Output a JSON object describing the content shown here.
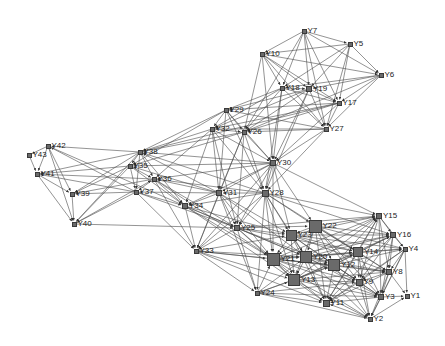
{
  "chart_data": {
    "type": "network",
    "title": "",
    "node_color": "#6a6a6a",
    "edge_color": "#4a4a4a",
    "nodes": [
      {
        "id": "Y1",
        "x": 407,
        "y": 296,
        "size": 5
      },
      {
        "id": "Y2",
        "x": 370,
        "y": 319,
        "size": 5
      },
      {
        "id": "Y3",
        "x": 381,
        "y": 297,
        "size": 6
      },
      {
        "id": "Y4",
        "x": 405,
        "y": 249,
        "size": 5
      },
      {
        "id": "Y5",
        "x": 350,
        "y": 44,
        "size": 5
      },
      {
        "id": "Y6",
        "x": 381,
        "y": 75,
        "size": 5
      },
      {
        "id": "Y7",
        "x": 304,
        "y": 31,
        "size": 5
      },
      {
        "id": "Y8",
        "x": 389,
        "y": 272,
        "size": 6
      },
      {
        "id": "Y9",
        "x": 359,
        "y": 282,
        "size": 7
      },
      {
        "id": "Y10",
        "x": 262,
        "y": 54,
        "size": 5
      },
      {
        "id": "Y11",
        "x": 326,
        "y": 303,
        "size": 7
      },
      {
        "id": "Y12",
        "x": 334,
        "y": 265,
        "size": 12
      },
      {
        "id": "Y13",
        "x": 294,
        "y": 280,
        "size": 12
      },
      {
        "id": "Y14",
        "x": 358,
        "y": 252,
        "size": 10
      },
      {
        "id": "Y15",
        "x": 379,
        "y": 216,
        "size": 6
      },
      {
        "id": "Y16",
        "x": 393,
        "y": 235,
        "size": 6
      },
      {
        "id": "Y17",
        "x": 339,
        "y": 103,
        "size": 5
      },
      {
        "id": "Y18",
        "x": 282,
        "y": 88,
        "size": 5
      },
      {
        "id": "Y19",
        "x": 309,
        "y": 89,
        "size": 6
      },
      {
        "id": "Y20",
        "x": 306,
        "y": 257,
        "size": 12
      },
      {
        "id": "Y21",
        "x": 273,
        "y": 259,
        "size": 13
      },
      {
        "id": "Y22",
        "x": 315,
        "y": 226,
        "size": 13
      },
      {
        "id": "Y23",
        "x": 291,
        "y": 235,
        "size": 11
      },
      {
        "id": "Y24",
        "x": 257,
        "y": 293,
        "size": 5
      },
      {
        "id": "Y25",
        "x": 237,
        "y": 228,
        "size": 6
      },
      {
        "id": "Y26",
        "x": 244,
        "y": 132,
        "size": 5
      },
      {
        "id": "Y27",
        "x": 326,
        "y": 129,
        "size": 5
      },
      {
        "id": "Y28",
        "x": 265,
        "y": 193,
        "size": 7
      },
      {
        "id": "Y29",
        "x": 226,
        "y": 110,
        "size": 5
      },
      {
        "id": "Y30",
        "x": 273,
        "y": 163,
        "size": 6
      },
      {
        "id": "Y31",
        "x": 219,
        "y": 193,
        "size": 6
      },
      {
        "id": "Y32",
        "x": 212,
        "y": 129,
        "size": 5
      },
      {
        "id": "Y33",
        "x": 196,
        "y": 251,
        "size": 5
      },
      {
        "id": "Y34",
        "x": 185,
        "y": 206,
        "size": 6
      },
      {
        "id": "Y35",
        "x": 130,
        "y": 166,
        "size": 5
      },
      {
        "id": "Y36",
        "x": 154,
        "y": 179,
        "size": 5
      },
      {
        "id": "Y37",
        "x": 136,
        "y": 192,
        "size": 5
      },
      {
        "id": "Y38",
        "x": 140,
        "y": 152,
        "size": 5
      },
      {
        "id": "Y39",
        "x": 72,
        "y": 194,
        "size": 5
      },
      {
        "id": "Y40",
        "x": 74,
        "y": 224,
        "size": 5
      },
      {
        "id": "Y41",
        "x": 37,
        "y": 174,
        "size": 5
      },
      {
        "id": "Y42",
        "x": 48,
        "y": 146,
        "size": 5
      },
      {
        "id": "Y43",
        "x": 29,
        "y": 155,
        "size": 5
      }
    ],
    "edges": [
      [
        "Y7",
        "Y10"
      ],
      [
        "Y7",
        "Y5"
      ],
      [
        "Y7",
        "Y6"
      ],
      [
        "Y7",
        "Y18"
      ],
      [
        "Y7",
        "Y19"
      ],
      [
        "Y7",
        "Y17"
      ],
      [
        "Y7",
        "Y27"
      ],
      [
        "Y7",
        "Y26"
      ],
      [
        "Y5",
        "Y10"
      ],
      [
        "Y5",
        "Y6"
      ],
      [
        "Y5",
        "Y18"
      ],
      [
        "Y5",
        "Y19"
      ],
      [
        "Y5",
        "Y17"
      ],
      [
        "Y5",
        "Y27"
      ],
      [
        "Y10",
        "Y6"
      ],
      [
        "Y10",
        "Y18"
      ],
      [
        "Y10",
        "Y19"
      ],
      [
        "Y10",
        "Y17"
      ],
      [
        "Y10",
        "Y27"
      ],
      [
        "Y10",
        "Y26"
      ],
      [
        "Y10",
        "Y30"
      ],
      [
        "Y6",
        "Y18"
      ],
      [
        "Y6",
        "Y19"
      ],
      [
        "Y6",
        "Y17"
      ],
      [
        "Y6",
        "Y26"
      ],
      [
        "Y6",
        "Y27"
      ],
      [
        "Y18",
        "Y19"
      ],
      [
        "Y18",
        "Y17"
      ],
      [
        "Y18",
        "Y27"
      ],
      [
        "Y18",
        "Y26"
      ],
      [
        "Y18",
        "Y29"
      ],
      [
        "Y18",
        "Y32"
      ],
      [
        "Y18",
        "Y30"
      ],
      [
        "Y18",
        "Y28"
      ],
      [
        "Y19",
        "Y17"
      ],
      [
        "Y19",
        "Y27"
      ],
      [
        "Y19",
        "Y26"
      ],
      [
        "Y19",
        "Y29"
      ],
      [
        "Y19",
        "Y32"
      ],
      [
        "Y19",
        "Y30"
      ],
      [
        "Y19",
        "Y28"
      ],
      [
        "Y17",
        "Y27"
      ],
      [
        "Y17",
        "Y26"
      ],
      [
        "Y17",
        "Y29"
      ],
      [
        "Y17",
        "Y32"
      ],
      [
        "Y17",
        "Y30"
      ],
      [
        "Y17",
        "Y38"
      ],
      [
        "Y27",
        "Y26"
      ],
      [
        "Y27",
        "Y32"
      ],
      [
        "Y27",
        "Y29"
      ],
      [
        "Y27",
        "Y30"
      ],
      [
        "Y27",
        "Y28"
      ],
      [
        "Y29",
        "Y32"
      ],
      [
        "Y29",
        "Y26"
      ],
      [
        "Y29",
        "Y30"
      ],
      [
        "Y29",
        "Y38"
      ],
      [
        "Y29",
        "Y35"
      ],
      [
        "Y29",
        "Y28"
      ],
      [
        "Y29",
        "Y31"
      ],
      [
        "Y32",
        "Y26"
      ],
      [
        "Y32",
        "Y30"
      ],
      [
        "Y32",
        "Y28"
      ],
      [
        "Y32",
        "Y31"
      ],
      [
        "Y32",
        "Y38"
      ],
      [
        "Y32",
        "Y36"
      ],
      [
        "Y32",
        "Y34"
      ],
      [
        "Y32",
        "Y25"
      ],
      [
        "Y26",
        "Y30"
      ],
      [
        "Y26",
        "Y28"
      ],
      [
        "Y26",
        "Y31"
      ],
      [
        "Y26",
        "Y38"
      ],
      [
        "Y26",
        "Y35"
      ],
      [
        "Y26",
        "Y25"
      ],
      [
        "Y26",
        "Y33"
      ],
      [
        "Y30",
        "Y28"
      ],
      [
        "Y30",
        "Y31"
      ],
      [
        "Y30",
        "Y38"
      ],
      [
        "Y30",
        "Y35"
      ],
      [
        "Y30",
        "Y36"
      ],
      [
        "Y30",
        "Y34"
      ],
      [
        "Y30",
        "Y25"
      ],
      [
        "Y30",
        "Y22"
      ],
      [
        "Y30",
        "Y23"
      ],
      [
        "Y30",
        "Y21"
      ],
      [
        "Y30",
        "Y15"
      ],
      [
        "Y30",
        "Y33"
      ],
      [
        "Y28",
        "Y31"
      ],
      [
        "Y28",
        "Y34"
      ],
      [
        "Y28",
        "Y36"
      ],
      [
        "Y28",
        "Y38"
      ],
      [
        "Y28",
        "Y25"
      ],
      [
        "Y28",
        "Y21"
      ],
      [
        "Y28",
        "Y23"
      ],
      [
        "Y28",
        "Y22"
      ],
      [
        "Y28",
        "Y20"
      ],
      [
        "Y28",
        "Y13"
      ],
      [
        "Y28",
        "Y15"
      ],
      [
        "Y28",
        "Y16"
      ],
      [
        "Y28",
        "Y14"
      ],
      [
        "Y28",
        "Y24"
      ],
      [
        "Y28",
        "Y33"
      ],
      [
        "Y31",
        "Y34"
      ],
      [
        "Y31",
        "Y36"
      ],
      [
        "Y31",
        "Y37"
      ],
      [
        "Y31",
        "Y38"
      ],
      [
        "Y31",
        "Y35"
      ],
      [
        "Y31",
        "Y25"
      ],
      [
        "Y31",
        "Y21"
      ],
      [
        "Y31",
        "Y23"
      ],
      [
        "Y31",
        "Y20"
      ],
      [
        "Y31",
        "Y33"
      ],
      [
        "Y31",
        "Y24"
      ],
      [
        "Y38",
        "Y35"
      ],
      [
        "Y38",
        "Y36"
      ],
      [
        "Y38",
        "Y37"
      ],
      [
        "Y38",
        "Y42"
      ],
      [
        "Y38",
        "Y41"
      ],
      [
        "Y38",
        "Y39"
      ],
      [
        "Y38",
        "Y40"
      ],
      [
        "Y38",
        "Y34"
      ],
      [
        "Y35",
        "Y36"
      ],
      [
        "Y35",
        "Y37"
      ],
      [
        "Y35",
        "Y41"
      ],
      [
        "Y35",
        "Y39"
      ],
      [
        "Y35",
        "Y40"
      ],
      [
        "Y35",
        "Y34"
      ],
      [
        "Y36",
        "Y37"
      ],
      [
        "Y36",
        "Y34"
      ],
      [
        "Y36",
        "Y41"
      ],
      [
        "Y36",
        "Y39"
      ],
      [
        "Y36",
        "Y33"
      ],
      [
        "Y36",
        "Y25"
      ],
      [
        "Y36",
        "Y21"
      ],
      [
        "Y37",
        "Y34"
      ],
      [
        "Y37",
        "Y39"
      ],
      [
        "Y37",
        "Y40"
      ],
      [
        "Y37",
        "Y41"
      ],
      [
        "Y37",
        "Y42"
      ],
      [
        "Y37",
        "Y33"
      ],
      [
        "Y37",
        "Y25"
      ],
      [
        "Y42",
        "Y43"
      ],
      [
        "Y42",
        "Y41"
      ],
      [
        "Y42",
        "Y39"
      ],
      [
        "Y42",
        "Y40"
      ],
      [
        "Y42",
        "Y34"
      ],
      [
        "Y43",
        "Y41"
      ],
      [
        "Y41",
        "Y39"
      ],
      [
        "Y41",
        "Y40"
      ],
      [
        "Y39",
        "Y40"
      ],
      [
        "Y40",
        "Y36"
      ],
      [
        "Y40",
        "Y25"
      ],
      [
        "Y34",
        "Y33"
      ],
      [
        "Y34",
        "Y25"
      ],
      [
        "Y34",
        "Y21"
      ],
      [
        "Y34",
        "Y23"
      ],
      [
        "Y34",
        "Y13"
      ],
      [
        "Y34",
        "Y20"
      ],
      [
        "Y25",
        "Y33"
      ],
      [
        "Y25",
        "Y21"
      ],
      [
        "Y25",
        "Y23"
      ],
      [
        "Y25",
        "Y22"
      ],
      [
        "Y25",
        "Y20"
      ],
      [
        "Y25",
        "Y13"
      ],
      [
        "Y25",
        "Y12"
      ],
      [
        "Y25",
        "Y14"
      ],
      [
        "Y25",
        "Y24"
      ],
      [
        "Y25",
        "Y15"
      ],
      [
        "Y33",
        "Y24"
      ],
      [
        "Y33",
        "Y21"
      ],
      [
        "Y33",
        "Y13"
      ],
      [
        "Y33",
        "Y20"
      ],
      [
        "Y33",
        "Y11"
      ],
      [
        "Y33",
        "Y12"
      ],
      [
        "Y33",
        "Y23"
      ],
      [
        "Y24",
        "Y21"
      ],
      [
        "Y24",
        "Y13"
      ],
      [
        "Y24",
        "Y11"
      ],
      [
        "Y24",
        "Y20"
      ],
      [
        "Y24",
        "Y12"
      ],
      [
        "Y24",
        "Y9"
      ],
      [
        "Y24",
        "Y3"
      ],
      [
        "Y24",
        "Y2"
      ],
      [
        "Y22",
        "Y23"
      ],
      [
        "Y22",
        "Y21"
      ],
      [
        "Y22",
        "Y20"
      ],
      [
        "Y22",
        "Y13"
      ],
      [
        "Y22",
        "Y12"
      ],
      [
        "Y22",
        "Y14"
      ],
      [
        "Y22",
        "Y15"
      ],
      [
        "Y22",
        "Y16"
      ],
      [
        "Y22",
        "Y4"
      ],
      [
        "Y22",
        "Y8"
      ],
      [
        "Y22",
        "Y9"
      ],
      [
        "Y22",
        "Y11"
      ],
      [
        "Y22",
        "Y3"
      ],
      [
        "Y23",
        "Y21"
      ],
      [
        "Y23",
        "Y20"
      ],
      [
        "Y23",
        "Y13"
      ],
      [
        "Y23",
        "Y12"
      ],
      [
        "Y23",
        "Y14"
      ],
      [
        "Y23",
        "Y15"
      ],
      [
        "Y23",
        "Y16"
      ],
      [
        "Y23",
        "Y4"
      ],
      [
        "Y23",
        "Y8"
      ],
      [
        "Y23",
        "Y9"
      ],
      [
        "Y23",
        "Y11"
      ],
      [
        "Y21",
        "Y20"
      ],
      [
        "Y21",
        "Y13"
      ],
      [
        "Y21",
        "Y12"
      ],
      [
        "Y21",
        "Y14"
      ],
      [
        "Y21",
        "Y15"
      ],
      [
        "Y21",
        "Y16"
      ],
      [
        "Y21",
        "Y8"
      ],
      [
        "Y21",
        "Y9"
      ],
      [
        "Y21",
        "Y11"
      ],
      [
        "Y21",
        "Y3"
      ],
      [
        "Y21",
        "Y2"
      ],
      [
        "Y20",
        "Y13"
      ],
      [
        "Y20",
        "Y12"
      ],
      [
        "Y20",
        "Y14"
      ],
      [
        "Y20",
        "Y15"
      ],
      [
        "Y20",
        "Y16"
      ],
      [
        "Y20",
        "Y4"
      ],
      [
        "Y20",
        "Y8"
      ],
      [
        "Y20",
        "Y9"
      ],
      [
        "Y20",
        "Y11"
      ],
      [
        "Y20",
        "Y3"
      ],
      [
        "Y20",
        "Y2"
      ],
      [
        "Y13",
        "Y12"
      ],
      [
        "Y13",
        "Y14"
      ],
      [
        "Y13",
        "Y15"
      ],
      [
        "Y13",
        "Y16"
      ],
      [
        "Y13",
        "Y8"
      ],
      [
        "Y13",
        "Y9"
      ],
      [
        "Y13",
        "Y11"
      ],
      [
        "Y13",
        "Y3"
      ],
      [
        "Y13",
        "Y2"
      ],
      [
        "Y12",
        "Y14"
      ],
      [
        "Y12",
        "Y15"
      ],
      [
        "Y12",
        "Y16"
      ],
      [
        "Y12",
        "Y4"
      ],
      [
        "Y12",
        "Y8"
      ],
      [
        "Y12",
        "Y9"
      ],
      [
        "Y12",
        "Y11"
      ],
      [
        "Y12",
        "Y3"
      ],
      [
        "Y12",
        "Y2"
      ],
      [
        "Y14",
        "Y15"
      ],
      [
        "Y14",
        "Y16"
      ],
      [
        "Y14",
        "Y4"
      ],
      [
        "Y14",
        "Y8"
      ],
      [
        "Y14",
        "Y9"
      ],
      [
        "Y14",
        "Y11"
      ],
      [
        "Y14",
        "Y3"
      ],
      [
        "Y14",
        "Y2"
      ],
      [
        "Y15",
        "Y16"
      ],
      [
        "Y15",
        "Y4"
      ],
      [
        "Y15",
        "Y8"
      ],
      [
        "Y15",
        "Y9"
      ],
      [
        "Y15",
        "Y11"
      ],
      [
        "Y15",
        "Y3"
      ],
      [
        "Y16",
        "Y4"
      ],
      [
        "Y16",
        "Y8"
      ],
      [
        "Y16",
        "Y9"
      ],
      [
        "Y16",
        "Y3"
      ],
      [
        "Y16",
        "Y11"
      ],
      [
        "Y4",
        "Y8"
      ],
      [
        "Y4",
        "Y9"
      ],
      [
        "Y4",
        "Y1"
      ],
      [
        "Y4",
        "Y3"
      ],
      [
        "Y4",
        "Y2"
      ],
      [
        "Y4",
        "Y11"
      ],
      [
        "Y8",
        "Y9"
      ],
      [
        "Y8",
        "Y3"
      ],
      [
        "Y8",
        "Y2"
      ],
      [
        "Y8",
        "Y11"
      ],
      [
        "Y8",
        "Y1"
      ],
      [
        "Y9",
        "Y3"
      ],
      [
        "Y9",
        "Y2"
      ],
      [
        "Y9",
        "Y11"
      ],
      [
        "Y3",
        "Y1"
      ],
      [
        "Y3",
        "Y2"
      ],
      [
        "Y3",
        "Y11"
      ],
      [
        "Y2",
        "Y1"
      ],
      [
        "Y2",
        "Y11"
      ]
    ]
  }
}
